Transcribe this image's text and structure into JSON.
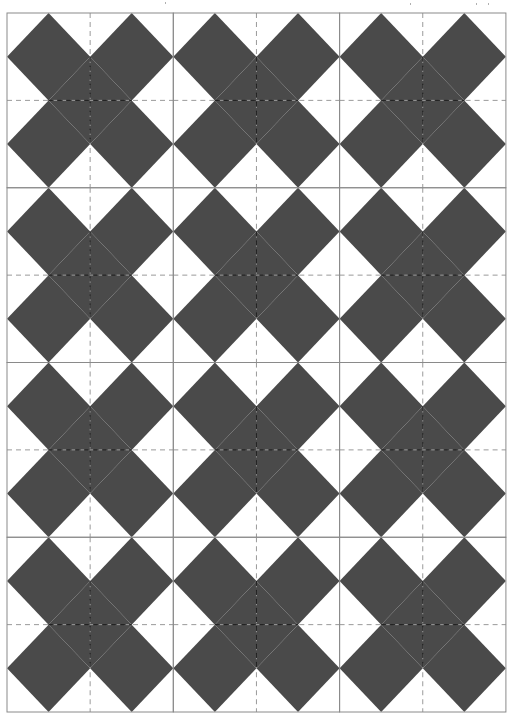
{
  "pattern": {
    "name": "x-block quilt pattern",
    "columns": 3,
    "rows": 4,
    "origin": {
      "x": 7,
      "y": 13
    },
    "block_width": 166.3,
    "block_height": 174.75,
    "colors": {
      "background": "#ffffff",
      "fill": "#4a4a4a",
      "block_border": "#8a8a8a",
      "dashed_guide": "#9a9a9a",
      "dashed_guide_on_fill": "#1e1e1e"
    },
    "motif": "X shape: four squares rotated 45 degrees per block, one per quadrant, each touching quadrant midlines",
    "guides": {
      "style": "dashed",
      "dash": "5,4",
      "position": "block center horizontal and vertical"
    }
  },
  "specks": [
    {
      "x": 165,
      "y": 2
    },
    {
      "x": 410,
      "y": 3
    },
    {
      "x": 476,
      "y": 3
    },
    {
      "x": 488,
      "y": 3
    }
  ]
}
